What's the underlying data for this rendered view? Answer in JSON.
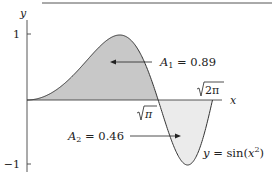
{
  "chart_data": {
    "type": "area",
    "title": "",
    "function_label": "y = sin(x²)",
    "function": "sin(x^2)",
    "xlabel": "x",
    "ylabel": "y",
    "xlim": [
      0,
      2.5066
    ],
    "ylim": [
      -1,
      1
    ],
    "yticks": [
      {
        "value": 1,
        "label": "1"
      },
      {
        "value": -1,
        "label": "−1"
      }
    ],
    "xticks": [
      {
        "value": 1.7725,
        "label": "√π"
      },
      {
        "value": 2.5066,
        "label": "√2π"
      }
    ],
    "regions": [
      {
        "name": "A1",
        "label": "A₁ = 0.89",
        "area": 0.89,
        "x_from": 0,
        "x_to": 1.7725,
        "fill": "#c8c8c8"
      },
      {
        "name": "A2",
        "label": "A₂ = 0.46",
        "area": 0.46,
        "x_from": 1.7725,
        "x_to": 2.5066,
        "fill": "#ebebeb"
      }
    ],
    "key_points": [
      {
        "x": 0,
        "y": 0
      },
      {
        "x": 1.2533,
        "y": 1
      },
      {
        "x": 1.7725,
        "y": 0
      },
      {
        "x": 2.1708,
        "y": -1
      },
      {
        "x": 2.5066,
        "y": 0
      }
    ],
    "grid": false,
    "legend": "none"
  },
  "labels": {
    "y_axis": "y",
    "x_axis": "x",
    "tick_one": "1",
    "tick_neg_one": "−1",
    "sqrt_pi": "π",
    "sqrt_2pi": "2π",
    "a1_prefix": "A",
    "a1_sub": "1",
    "a1_value": " = 0.89",
    "a2_prefix": "A",
    "a2_sub": "2",
    "a2_value": " = 0.46",
    "func_y": "y",
    "func_eq": " = sin(",
    "func_x": "x",
    "func_sup": "2",
    "func_close": ")"
  },
  "colors": {
    "a1_fill": "#c8c8c8",
    "a2_fill": "#ebebeb",
    "stroke": "#333333"
  }
}
